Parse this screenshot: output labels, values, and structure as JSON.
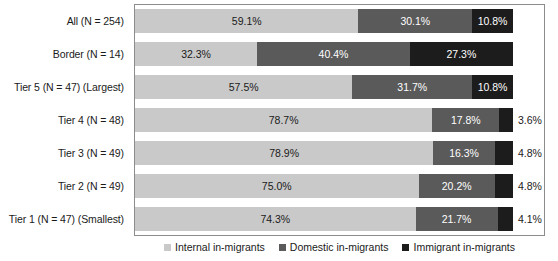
{
  "chart_data": {
    "type": "bar",
    "orientation": "horizontal",
    "stacked": true,
    "normalized": true,
    "title": "",
    "xlabel": "",
    "ylabel": "",
    "xlim": [
      0,
      100
    ],
    "grid": false,
    "legend_position": "bottom",
    "categories": [
      "All (N = 254)",
      "Border (N = 14)",
      "Tier 5 (N = 47) (Largest)",
      "Tier 4 (N = 48)",
      "Tier 3 (N = 49)",
      "Tier 2 (N = 49)",
      "Tier 1 (N = 47) (Smallest)"
    ],
    "series": [
      {
        "name": "Internal in-migrants",
        "color": "#c9c9c9",
        "values": [
          59.1,
          32.3,
          57.5,
          78.7,
          78.9,
          75.0,
          74.3
        ],
        "labels": [
          "59.1%",
          "32.3%",
          "57.5%",
          "78.7%",
          "78.9%",
          "75.0%",
          "74.3%"
        ]
      },
      {
        "name": "Domestic in-migrants",
        "color": "#5a5a5a",
        "values": [
          30.1,
          40.4,
          31.7,
          17.8,
          16.3,
          20.2,
          21.7
        ],
        "labels": [
          "30.1%",
          "40.4%",
          "31.7%",
          "17.8%",
          "16.3%",
          "20.2%",
          "21.7%"
        ]
      },
      {
        "name": "Immigrant in-migrants",
        "color": "#1c1c1c",
        "values": [
          10.8,
          27.3,
          10.8,
          3.6,
          4.8,
          4.8,
          4.1
        ],
        "labels": [
          "10.8%",
          "27.3%",
          "10.8%",
          "3.6%",
          "4.8%",
          "4.8%",
          "4.1%"
        ]
      }
    ],
    "label_placement": [
      [
        "inside",
        "inside",
        "inside"
      ],
      [
        "inside",
        "inside",
        "inside"
      ],
      [
        "inside",
        "inside",
        "inside"
      ],
      [
        "inside",
        "inside",
        "outside"
      ],
      [
        "inside",
        "inside",
        "outside"
      ],
      [
        "inside",
        "inside",
        "outside"
      ],
      [
        "inside",
        "inside",
        "outside"
      ]
    ]
  },
  "legend": {
    "items": [
      {
        "label": "Internal in-migrants"
      },
      {
        "label": "Domestic in-migrants"
      },
      {
        "label": "Immigrant in-migrants"
      }
    ]
  }
}
